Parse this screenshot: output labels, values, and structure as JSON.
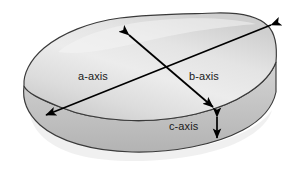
{
  "figure": {
    "type": "clast-axes-diagram",
    "background_color": "#ffffff"
  },
  "labels": {
    "a_axis": "a-axis",
    "b_axis": "b-axis",
    "c_axis": "c-axis"
  },
  "colors": {
    "outline": "#2b2b2b",
    "arrow": "#000000",
    "label_text": "#1a1a1a",
    "fill_light": "#f2f2f2",
    "fill_mid": "#d8d8d8",
    "fill_dark": "#b9b9b9",
    "side_face": "#c4c4c4",
    "shadow": "#e3e3e3"
  },
  "axes": [
    {
      "name": "a-axis",
      "label": "a-axis",
      "arrow_style": "double-headed",
      "orientation": "long diagonal, upper-right to lower-left",
      "from": {
        "x": 275,
        "y": 22
      },
      "to": {
        "x": 42,
        "y": 117
      },
      "label_position": {
        "x": 78,
        "y": 71
      }
    },
    {
      "name": "b-axis",
      "label": "b-axis",
      "arrow_style": "double-headed",
      "orientation": "short diagonal, upper-left to lower-right",
      "from": {
        "x": 126,
        "y": 32
      },
      "to": {
        "x": 215,
        "y": 110
      },
      "label_position": {
        "x": 189,
        "y": 71
      }
    },
    {
      "name": "c-axis",
      "label": "c-axis",
      "arrow_style": "double-headed",
      "orientation": "vertical, thickness of clast",
      "from": {
        "x": 217,
        "y": 114
      },
      "to": {
        "x": 217,
        "y": 141
      },
      "label_position": {
        "x": 169,
        "y": 121
      }
    }
  ]
}
